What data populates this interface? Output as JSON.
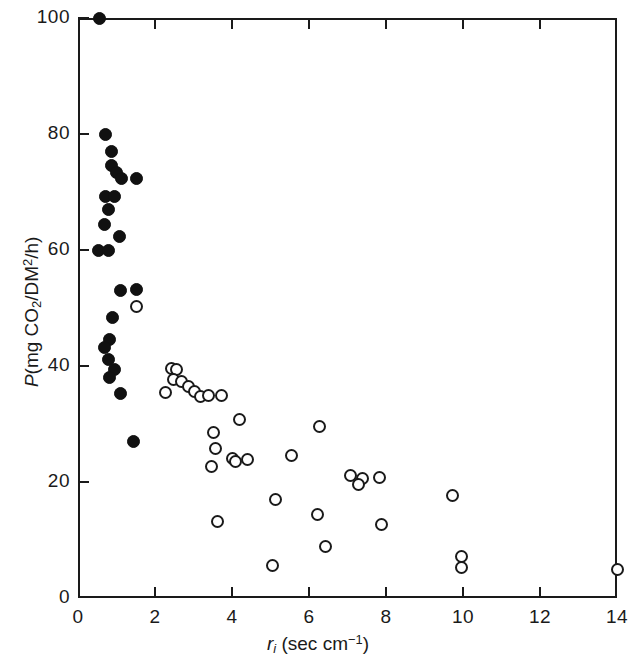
{
  "chart_data": {
    "type": "scatter",
    "title": "",
    "xlabel": "r_i (sec cm^-1)",
    "ylabel": "P(mg CO2/DM2/h)",
    "xlabel_parts": {
      "symbol": "r",
      "subscript": "i",
      "units_open": " (sec cm",
      "units_sup": "−1",
      "units_close": ")"
    },
    "ylabel_parts": {
      "symbol": "P",
      "open": "(mg CO",
      "sub1": "2",
      "mid": "/DM",
      "sup1": "2",
      "close": "/h)"
    },
    "xlim": [
      0,
      14
    ],
    "ylim": [
      0,
      100
    ],
    "xticks": [
      0,
      2,
      4,
      6,
      8,
      10,
      12,
      14
    ],
    "xticklabels": [
      "0",
      "2",
      "4",
      "6",
      "8",
      "10",
      "12",
      "14"
    ],
    "yticks": [
      0,
      20,
      40,
      60,
      80,
      100
    ],
    "yticklabels": [
      "0",
      "20",
      "40",
      "60",
      "80",
      "100"
    ],
    "grid": false,
    "legend": null,
    "series": [
      {
        "name": "closed-circles",
        "marker": "filled-circle",
        "color": "#111111",
        "points": [
          [
            0.55,
            100.0
          ],
          [
            0.72,
            80.0
          ],
          [
            0.88,
            77.0
          ],
          [
            0.86,
            74.6
          ],
          [
            1.0,
            73.3
          ],
          [
            1.12,
            72.3
          ],
          [
            1.52,
            72.3
          ],
          [
            0.72,
            69.2
          ],
          [
            0.95,
            69.2
          ],
          [
            0.8,
            67.0
          ],
          [
            0.7,
            64.4
          ],
          [
            1.08,
            62.3
          ],
          [
            0.52,
            60.0
          ],
          [
            0.8,
            60.0
          ],
          [
            1.1,
            53.0
          ],
          [
            1.52,
            53.2
          ],
          [
            0.9,
            48.4
          ],
          [
            0.82,
            44.5
          ],
          [
            0.68,
            43.2
          ],
          [
            0.8,
            41.2
          ],
          [
            0.96,
            39.4
          ],
          [
            0.82,
            38.0
          ],
          [
            1.1,
            35.2
          ],
          [
            1.45,
            27.0
          ]
        ]
      },
      {
        "name": "open-circles",
        "marker": "open-circle",
        "color": "#1a1a1a",
        "points": [
          [
            1.52,
            50.2
          ],
          [
            2.42,
            39.6
          ],
          [
            2.55,
            39.4
          ],
          [
            2.48,
            37.6
          ],
          [
            2.7,
            37.4
          ],
          [
            2.88,
            36.4
          ],
          [
            3.02,
            35.6
          ],
          [
            3.18,
            34.8
          ],
          [
            3.4,
            35.0
          ],
          [
            3.72,
            35.0
          ],
          [
            2.28,
            35.4
          ],
          [
            4.2,
            30.8
          ],
          [
            3.52,
            28.5
          ],
          [
            6.28,
            29.6
          ],
          [
            3.58,
            25.8
          ],
          [
            4.02,
            24.0
          ],
          [
            4.1,
            23.5
          ],
          [
            4.4,
            23.8
          ],
          [
            5.55,
            24.6
          ],
          [
            3.48,
            22.6
          ],
          [
            7.08,
            21.2
          ],
          [
            7.38,
            20.6
          ],
          [
            7.28,
            19.6
          ],
          [
            7.82,
            20.8
          ],
          [
            9.72,
            17.6
          ],
          [
            5.12,
            17.0
          ],
          [
            6.22,
            14.4
          ],
          [
            7.88,
            12.6
          ],
          [
            3.62,
            13.2
          ],
          [
            6.42,
            8.8
          ],
          [
            9.95,
            7.2
          ],
          [
            9.95,
            5.2
          ],
          [
            5.05,
            5.6
          ],
          [
            14.0,
            5.0
          ]
        ]
      }
    ]
  }
}
